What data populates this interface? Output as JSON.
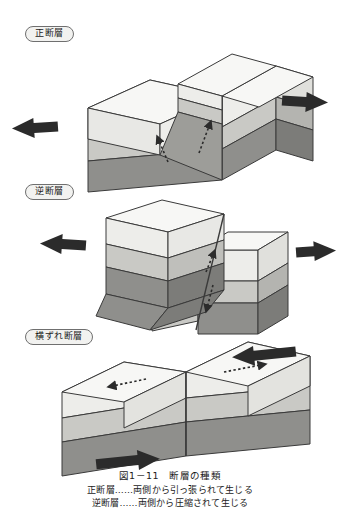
{
  "figure": {
    "kind": "textbook-illustration",
    "language": "ja",
    "background_color": "#ffffff",
    "ink_color": "#231f20",
    "panels": [
      {
        "id": "normal-fault",
        "label": "正断層",
        "stress_arrows": [
          "left",
          "right"
        ],
        "stress_sense": "extension",
        "slip_arrows": [
          "down-left",
          "up-right"
        ]
      },
      {
        "id": "reverse-fault",
        "label": "逆断層",
        "stress_arrows": [
          "right",
          "left"
        ],
        "stress_sense": "compression",
        "slip_arrows": [
          "up-left",
          "down-right"
        ]
      },
      {
        "id": "strike-slip-fault",
        "label": "横ずれ断層",
        "stress_arrows": [
          "left",
          "right"
        ],
        "stress_sense": "shear",
        "slip_arrows": [
          "left",
          "right"
        ]
      }
    ],
    "strata_colors": {
      "top_surface": "#f7f7f5",
      "layer_1": "#ededea",
      "layer_2": "#c9c9c5",
      "layer_3": "#8f8f8c",
      "side_shade_1": "#e0e0dc",
      "side_shade_2": "#b4b4b0",
      "side_shade_3": "#7c7c79",
      "fault_plane": "#9d9d99",
      "outline": "#3a3a3a",
      "arrow_fill": "#2b2b2b"
    }
  },
  "caption": {
    "title": "図1－11　断層の種類",
    "line_1": "正断層……両側から引っ張られて生じる",
    "line_2": "逆断層……両側から圧縮されて生じる"
  }
}
